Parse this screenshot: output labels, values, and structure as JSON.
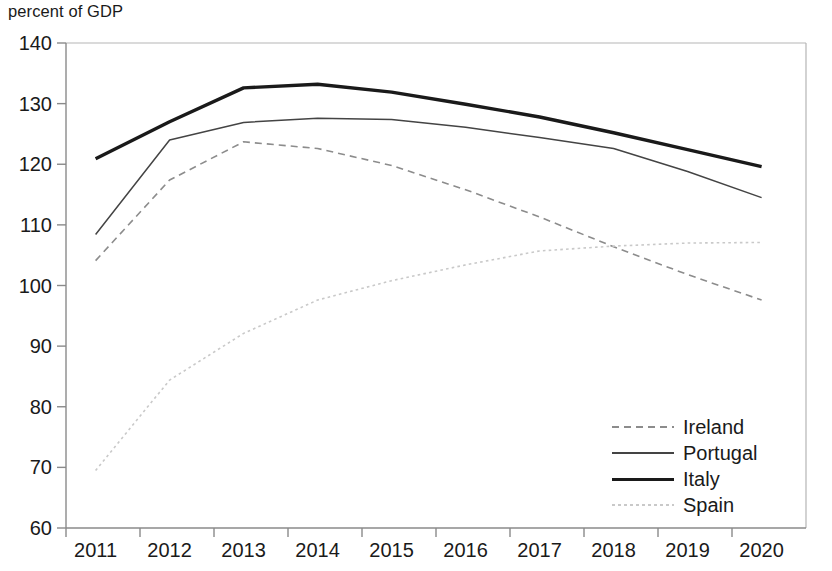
{
  "chart_data": {
    "type": "line",
    "title": "",
    "ylabel": "percent of GDP",
    "xlabel": "",
    "x": [
      2011,
      2012,
      2013,
      2014,
      2015,
      2016,
      2017,
      2018,
      2019,
      2020
    ],
    "xticklabels": [
      "2011",
      "2012",
      "2013",
      "2014",
      "2015",
      "2016",
      "2017",
      "2018",
      "2019",
      "2020"
    ],
    "yticklabels": [
      "140",
      "130",
      "120",
      "110",
      "100",
      "90",
      "80",
      "70",
      "60"
    ],
    "ylim": [
      60,
      140
    ],
    "ytick_values": [
      140,
      130,
      120,
      110,
      100,
      90,
      80,
      70,
      60
    ],
    "grid": false,
    "legend_position": "lower right",
    "series": [
      {
        "name": "Ireland",
        "style": "dashed",
        "color": "#8c8c8c",
        "width": 1.6,
        "values": [
          104.1,
          117.4,
          123.7,
          122.6,
          119.8,
          115.8,
          111.3,
          106.4,
          101.8,
          97.6
        ]
      },
      {
        "name": "Portugal",
        "style": "solid",
        "color": "#444444",
        "width": 1.5,
        "values": [
          108.4,
          124.0,
          126.9,
          127.6,
          127.4,
          126.1,
          124.4,
          122.6,
          118.8,
          114.5
        ]
      },
      {
        "name": "Italy",
        "style": "solid",
        "color": "#1a1a1a",
        "width": 3.4,
        "values": [
          120.9,
          127.0,
          132.6,
          133.2,
          131.9,
          129.9,
          127.8,
          125.2,
          122.4,
          119.6
        ]
      },
      {
        "name": "Spain",
        "style": "dotted",
        "color": "#c9c9c9",
        "width": 1.6,
        "values": [
          69.5,
          84.4,
          92.1,
          97.6,
          100.8,
          103.4,
          105.7,
          106.5,
          107.0,
          107.1
        ]
      }
    ]
  },
  "legend": {
    "items": [
      {
        "label": "Ireland"
      },
      {
        "label": "Portugal"
      },
      {
        "label": "Italy"
      },
      {
        "label": "Spain"
      }
    ]
  }
}
